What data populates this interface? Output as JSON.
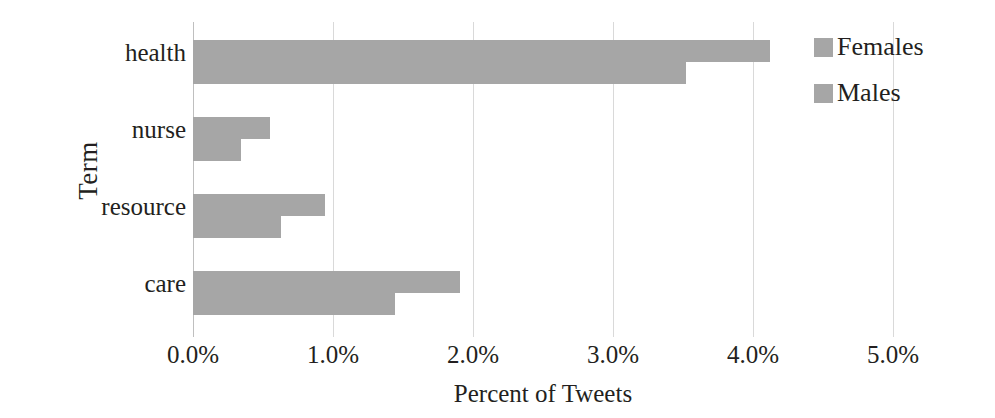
{
  "chart_data": {
    "type": "bar",
    "orientation": "horizontal",
    "title": "",
    "xlabel": "Percent of Tweets",
    "ylabel": "Term",
    "categories": [
      "health",
      "nurse",
      "resource",
      "care"
    ],
    "series": [
      {
        "name": "Females",
        "values": [
          4.12,
          0.55,
          0.94,
          1.91
        ],
        "color": "#a6a6a6"
      },
      {
        "name": "Males",
        "values": [
          3.52,
          0.34,
          0.63,
          1.44
        ],
        "color": "#a6a6a6"
      }
    ],
    "xlim": [
      0.0,
      5.0
    ],
    "xticks": [
      0.0,
      1.0,
      2.0,
      3.0,
      4.0,
      5.0
    ],
    "xtick_labels": [
      "0.0%",
      "1.0%",
      "2.0%",
      "3.0%",
      "4.0%",
      "5.0%"
    ],
    "ytick_labels": [
      "health",
      "nurse",
      "resource",
      "care"
    ],
    "grid": true,
    "grid_axis": "x",
    "grid_color": "#d9d9d9",
    "legend": {
      "position": "right",
      "entries": [
        {
          "label": "Females",
          "color": "#a6a6a6"
        },
        {
          "label": "Males",
          "color": "#a6a6a6"
        }
      ]
    },
    "background": "#ffffff"
  },
  "axes": {
    "y_title": "Term",
    "x_title": "Percent of Tweets"
  }
}
